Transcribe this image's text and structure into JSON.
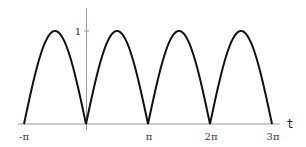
{
  "chart_data": {
    "type": "line",
    "title": "",
    "xlabel": "t",
    "ylabel": "",
    "function": "|sin(t)|",
    "xlim": [
      -3.14159,
      9.42478
    ],
    "ylim": [
      0,
      1.2
    ],
    "x_ticks": [
      {
        "value": -3.14159,
        "label": "-π"
      },
      {
        "value": 3.14159,
        "label": "π"
      },
      {
        "value": 6.28319,
        "label": "2π"
      },
      {
        "value": 9.42478,
        "label": "3π"
      }
    ],
    "y_ticks": [
      {
        "value": 1,
        "label": "1"
      }
    ],
    "grid": false,
    "legend": null,
    "series": [
      {
        "name": "|sin t|",
        "x": [
          -3.14159,
          -2.35619,
          -1.5708,
          -0.7854,
          0,
          0.7854,
          1.5708,
          2.35619,
          3.14159,
          3.92699,
          4.71239,
          5.49779,
          6.28319,
          7.06858,
          7.85398,
          8.63938,
          9.42478
        ],
        "values": [
          0,
          0.707,
          1,
          0.707,
          0,
          0.707,
          1,
          0.707,
          0,
          0.707,
          1,
          0.707,
          0,
          0.707,
          1,
          0.707,
          0
        ]
      }
    ]
  },
  "labels": {
    "x_axis": "t",
    "tick_neg_pi": "-π",
    "tick_pi": "π",
    "tick_2pi": "2π",
    "tick_3pi": "3π",
    "tick_one": "1"
  }
}
